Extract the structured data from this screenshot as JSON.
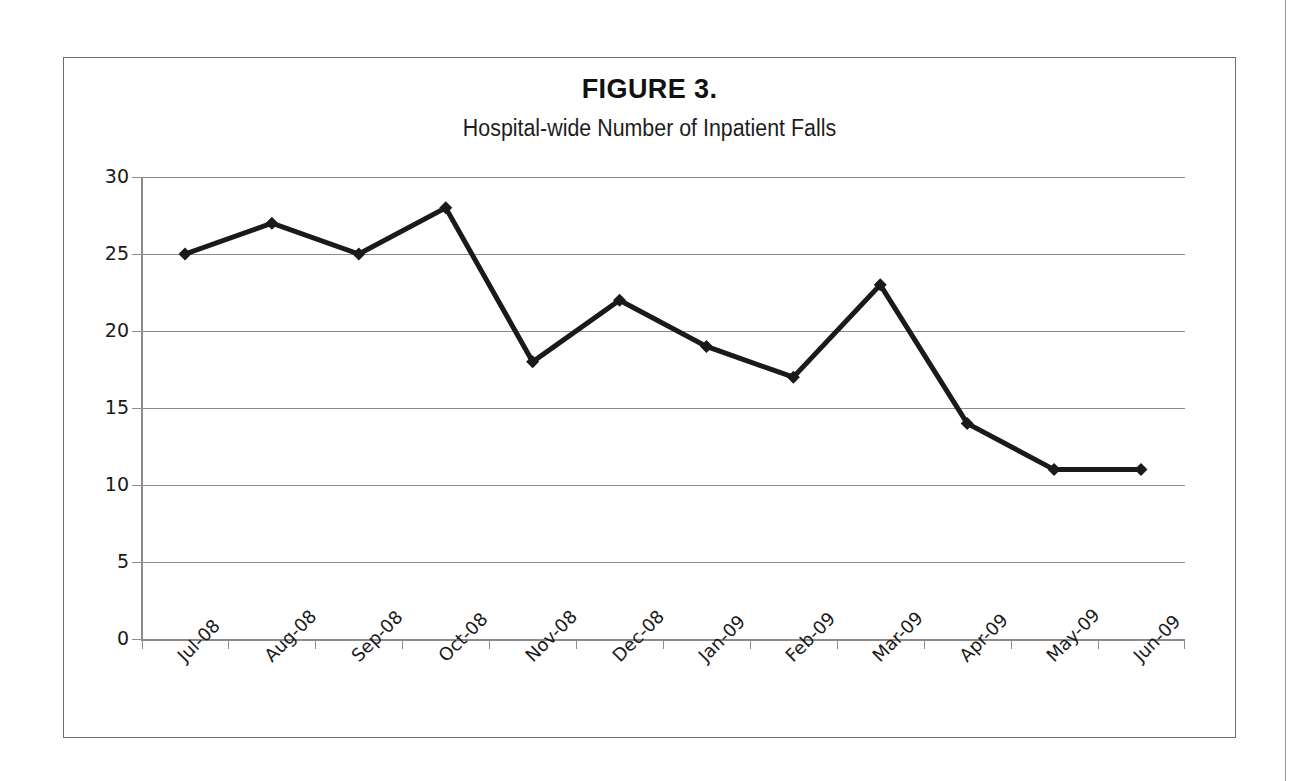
{
  "figure": {
    "title": "FIGURE 3.",
    "subtitle": "Hospital-wide Number of Inpatient Falls"
  },
  "chart_data": {
    "type": "line",
    "title": "FIGURE 3.",
    "subtitle": "Hospital-wide Number of Inpatient Falls",
    "xlabel": "",
    "ylabel": "",
    "categories": [
      "Jul-08",
      "Aug-08",
      "Sep-08",
      "Oct-08",
      "Nov-08",
      "Dec-08",
      "Jan-09",
      "Feb-09",
      "Mar-09",
      "Apr-09",
      "May-09",
      "Jun-09"
    ],
    "values": [
      25,
      27,
      25,
      28,
      18,
      22,
      19,
      17,
      23,
      14,
      11,
      11
    ],
    "series": [
      {
        "name": "Inpatient Falls",
        "values": [
          25,
          27,
          25,
          28,
          18,
          22,
          19,
          17,
          23,
          14,
          11,
          11
        ]
      }
    ],
    "ylim": [
      0,
      30
    ],
    "yticks": [
      0,
      5,
      10,
      15,
      20,
      25,
      30
    ],
    "ytick_labels": [
      "0",
      "5",
      "10",
      "15",
      "20",
      "25",
      "30"
    ],
    "grid": true,
    "grid_axis": "y",
    "legend": false,
    "legend_position": "none",
    "marker": "diamond",
    "line_color": "#1a1a1a",
    "marker_color": "#1a1a1a",
    "grid_color": "#8c8c8c",
    "background_color": "#ffffff"
  }
}
